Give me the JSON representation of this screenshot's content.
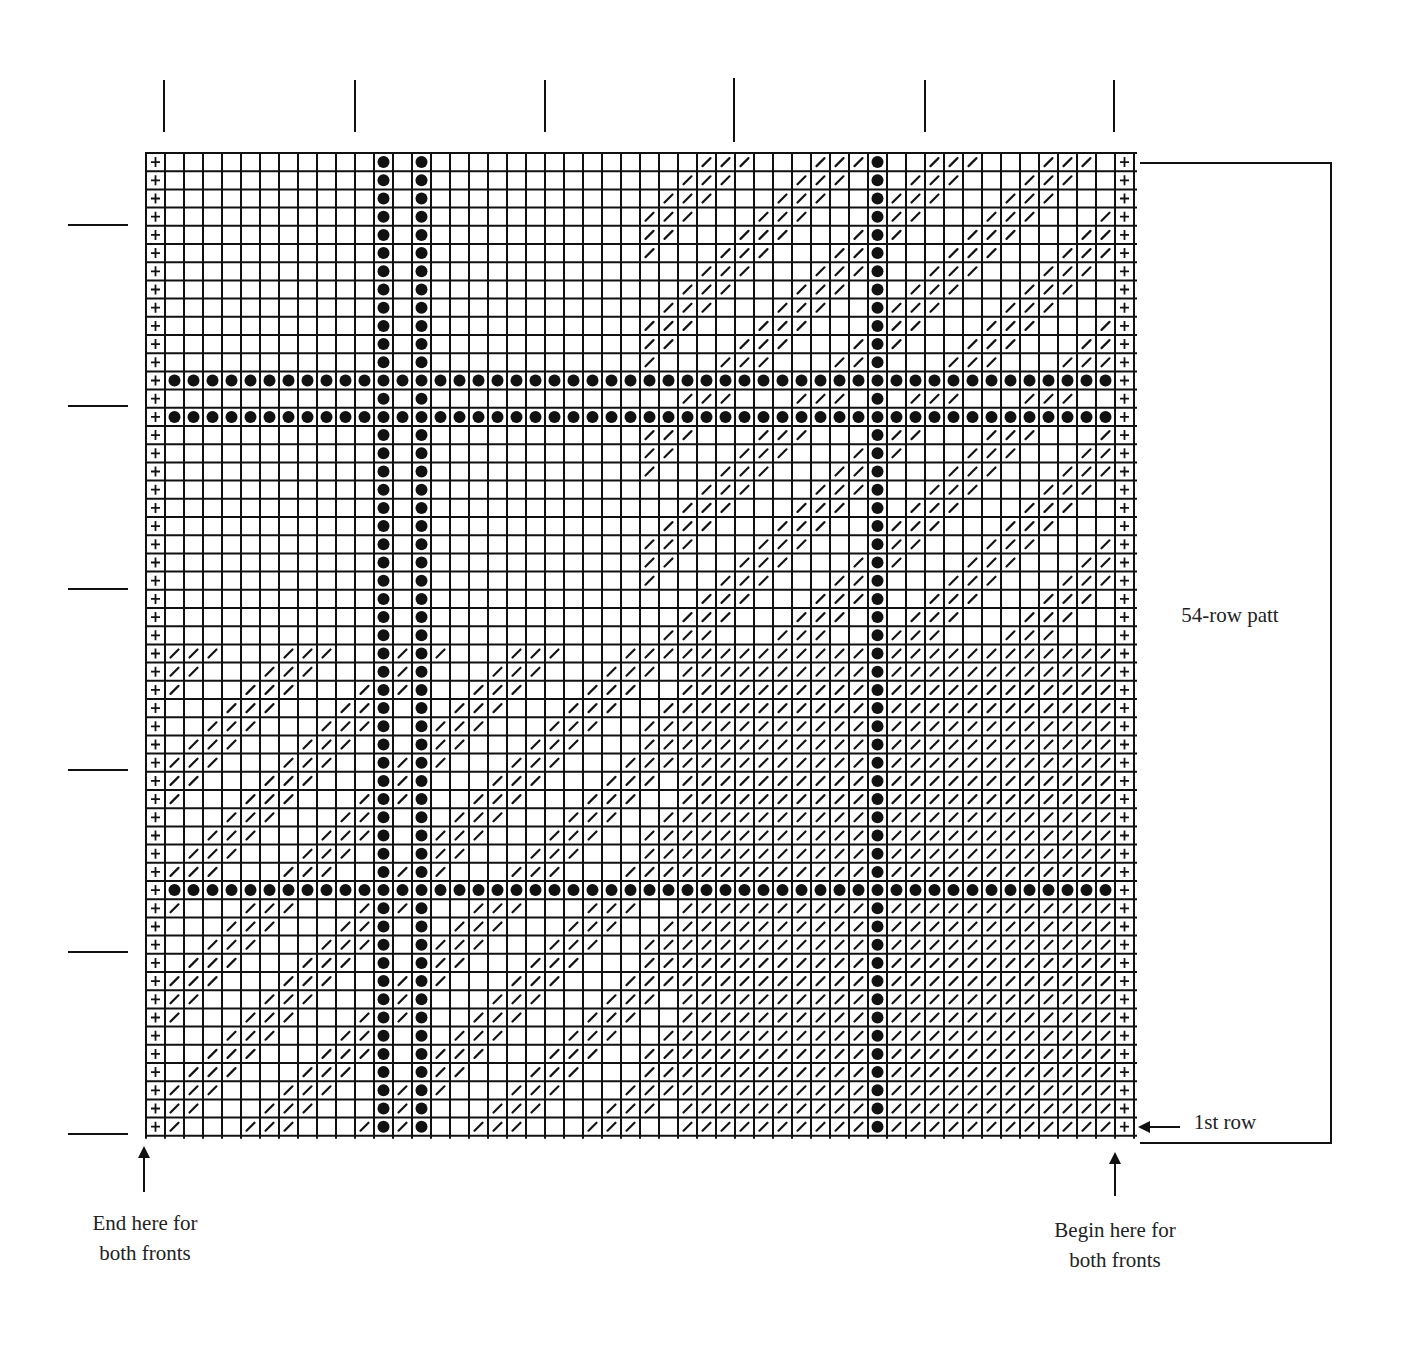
{
  "labels": {
    "repeat": "54-row patt",
    "first_row": "1st row",
    "end_line1": "End here for",
    "end_line2": "both fronts",
    "begin_line1": "Begin here for",
    "begin_line2": "both fronts"
  },
  "chart_data": {
    "type": "table",
    "columns": 52,
    "rows": 54,
    "symbols": {
      "plus": "+ (edge stitch)",
      "dot": "● (purl/bobble)",
      "slash": "/ (twist/slip stitch)",
      "blank": "empty square"
    },
    "edge_plus_columns": [
      0,
      51
    ],
    "dot_columns": [
      12,
      14,
      38
    ],
    "dot_rows_from_top": [
      12,
      14,
      40
    ],
    "regions": [
      {
        "name": "upper-right-diagonals",
        "rows": [
          0,
          26
        ],
        "cols": [
          26,
          50
        ],
        "rule": "slash when (c + r) mod 6 in {5,0,1}"
      },
      {
        "name": "lower-left-diagonals",
        "rows": [
          27,
          53
        ],
        "cols": [
          1,
          25
        ],
        "rule": "slash when (c + r - 27) mod 6 in {1,2,3}"
      },
      {
        "name": "lower-right-dense",
        "rows": [
          27,
          53
        ],
        "cols": [
          26,
          50
        ],
        "rule": "slash except diagonal gap band near left edge"
      }
    ],
    "top_ticks_x": [
      164,
      355,
      545,
      734,
      925,
      1114
    ],
    "left_ticks_y": [
      225,
      406,
      589,
      770,
      952,
      1134
    ],
    "annotations": [
      "54-row patt",
      "1st row",
      "End here for both fronts",
      "Begin here for both fronts"
    ]
  }
}
